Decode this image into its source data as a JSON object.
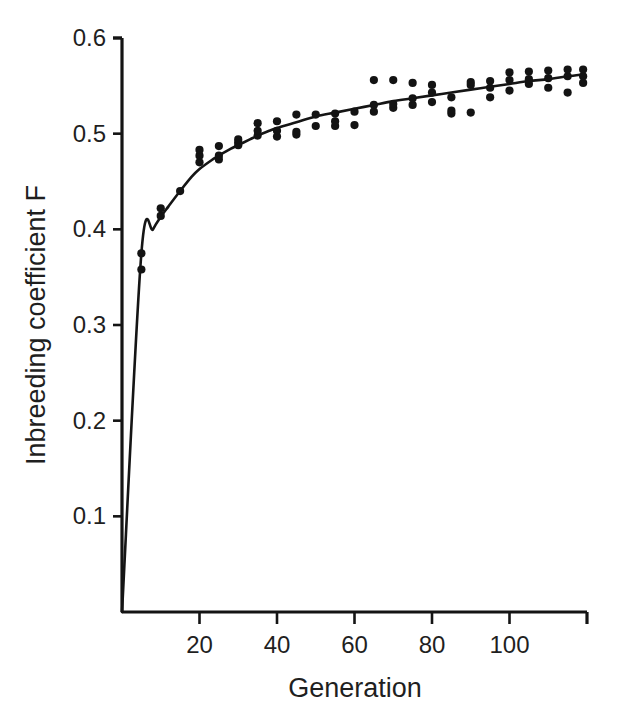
{
  "chart_data": {
    "type": "scatter",
    "title": "",
    "subtitle": "",
    "xlabel": "Generation",
    "ylabel": "Inbreeding coefficient F",
    "xlim": [
      0,
      120
    ],
    "ylim": [
      0.0,
      0.6
    ],
    "xticks": [
      20,
      40,
      60,
      80,
      100
    ],
    "xticklabels": [
      "20",
      "40",
      "60",
      "80",
      "100"
    ],
    "yticks": [
      0.1,
      0.2,
      0.3,
      0.4,
      0.5,
      0.6
    ],
    "yticklabels": [
      "0.1",
      "0.2",
      "0.3",
      "0.4",
      "0.5",
      "0.6"
    ],
    "grid": false,
    "legend": null,
    "marker": "filled-circle",
    "marker_color": "#131313",
    "line_color": "#151515",
    "background_color": "#ffffff",
    "series": [
      {
        "name": "Observed inbreeding coefficient",
        "type": "scatter",
        "points": [
          [
            5,
            0.358
          ],
          [
            5,
            0.375
          ],
          [
            10,
            0.414
          ],
          [
            10,
            0.422
          ],
          [
            15,
            0.44
          ],
          [
            20,
            0.47
          ],
          [
            20,
            0.477
          ],
          [
            20,
            0.483
          ],
          [
            25,
            0.473
          ],
          [
            25,
            0.477
          ],
          [
            25,
            0.487
          ],
          [
            30,
            0.488
          ],
          [
            30,
            0.491
          ],
          [
            30,
            0.494
          ],
          [
            35,
            0.498
          ],
          [
            35,
            0.503
          ],
          [
            35,
            0.511
          ],
          [
            40,
            0.497
          ],
          [
            40,
            0.503
          ],
          [
            40,
            0.513
          ],
          [
            45,
            0.499
          ],
          [
            45,
            0.502
          ],
          [
            45,
            0.52
          ],
          [
            50,
            0.508
          ],
          [
            50,
            0.52
          ],
          [
            55,
            0.508
          ],
          [
            55,
            0.513
          ],
          [
            55,
            0.521
          ],
          [
            60,
            0.509
          ],
          [
            60,
            0.523
          ],
          [
            65,
            0.523
          ],
          [
            65,
            0.53
          ],
          [
            65,
            0.556
          ],
          [
            70,
            0.527
          ],
          [
            70,
            0.531
          ],
          [
            70,
            0.556
          ],
          [
            75,
            0.53
          ],
          [
            75,
            0.537
          ],
          [
            75,
            0.553
          ],
          [
            80,
            0.533
          ],
          [
            80,
            0.543
          ],
          [
            80,
            0.551
          ],
          [
            85,
            0.521
          ],
          [
            85,
            0.524
          ],
          [
            85,
            0.538
          ],
          [
            90,
            0.522
          ],
          [
            90,
            0.551
          ],
          [
            90,
            0.554
          ],
          [
            95,
            0.538
          ],
          [
            95,
            0.548
          ],
          [
            95,
            0.555
          ],
          [
            100,
            0.545
          ],
          [
            100,
            0.556
          ],
          [
            100,
            0.564
          ],
          [
            105,
            0.552
          ],
          [
            105,
            0.557
          ],
          [
            105,
            0.565
          ],
          [
            110,
            0.548
          ],
          [
            110,
            0.558
          ],
          [
            110,
            0.566
          ],
          [
            115,
            0.543
          ],
          [
            115,
            0.56
          ],
          [
            115,
            0.567
          ],
          [
            119,
            0.553
          ],
          [
            119,
            0.56
          ],
          [
            119,
            0.567
          ]
        ]
      },
      {
        "name": "Fitted accumulation curve",
        "type": "line",
        "points": [
          [
            0,
            0.0
          ],
          [
            5,
            0.375
          ],
          [
            8,
            0.4
          ],
          [
            10,
            0.413
          ],
          [
            12,
            0.424
          ],
          [
            15,
            0.44
          ],
          [
            18,
            0.455
          ],
          [
            20,
            0.463
          ],
          [
            23,
            0.472
          ],
          [
            25,
            0.477
          ],
          [
            28,
            0.484
          ],
          [
            30,
            0.488
          ],
          [
            33,
            0.494
          ],
          [
            35,
            0.498
          ],
          [
            38,
            0.503
          ],
          [
            40,
            0.506
          ],
          [
            45,
            0.512
          ],
          [
            50,
            0.518
          ],
          [
            55,
            0.522
          ],
          [
            60,
            0.526
          ],
          [
            65,
            0.53
          ],
          [
            70,
            0.534
          ],
          [
            75,
            0.537
          ],
          [
            80,
            0.54
          ],
          [
            85,
            0.543
          ],
          [
            90,
            0.546
          ],
          [
            95,
            0.549
          ],
          [
            100,
            0.552
          ],
          [
            105,
            0.555
          ],
          [
            110,
            0.557
          ],
          [
            115,
            0.56
          ],
          [
            119,
            0.562
          ]
        ]
      }
    ]
  },
  "axes": {
    "x_axis_name": "generation-axis",
    "y_axis_name": "inbreeding-coefficient-axis"
  }
}
